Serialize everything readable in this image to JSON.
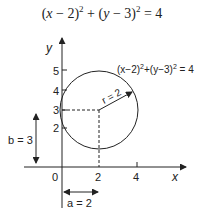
{
  "title": {
    "equation_parts": [
      "(",
      "x",
      " − 2)",
      "2",
      " + (",
      "y",
      " − 3)",
      "2",
      " = 4"
    ]
  },
  "diagram": {
    "axis_x_label": "x",
    "axis_y_label": "y",
    "x_ticks": [
      "0",
      "2",
      "4"
    ],
    "y_ticks": [
      "2",
      "3",
      "4",
      "5"
    ],
    "circle_label": {
      "base": "(x−2)",
      "sup1": "2",
      "mid": "+(y−3)",
      "sup2": "2",
      "end": " = 4"
    },
    "radius_label": "r = 2",
    "b_label": "b = 3",
    "a_label": "a = 2",
    "center": {
      "x": 2,
      "y": 3
    },
    "radius": 2,
    "stroke_color": "#222222"
  }
}
